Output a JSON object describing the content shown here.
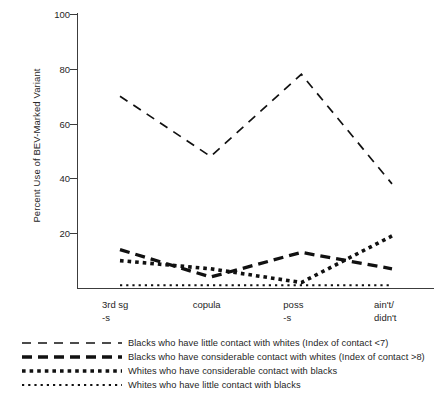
{
  "chart_data": {
    "type": "line",
    "title": "",
    "xlabel": "",
    "ylabel": "Percent Use of BEV-Marked Variant",
    "ylim": [
      0,
      100
    ],
    "yticks": [
      100,
      80,
      60,
      40,
      20
    ],
    "ytick_labels": [
      "100",
      "80",
      "60",
      "40",
      "20"
    ],
    "grid": false,
    "legend_position": "below",
    "categories": [
      "3rd sg -s",
      "copula",
      "poss -s",
      "ain't/didn't"
    ],
    "category_lines": [
      {
        "line1": "3rd sg",
        "line2": "-s"
      },
      {
        "line1": "copula",
        "line2": ""
      },
      {
        "line1": "poss",
        "line2": "-s"
      },
      {
        "line1": "ain't/",
        "line2": "didn't"
      }
    ],
    "series": [
      {
        "name": "Blacks who have little contact with whites (Index of contact <7)",
        "style": "thin-dash",
        "values": [
          70,
          48,
          78,
          38
        ]
      },
      {
        "name": "Blacks who have considerable contact with whites (Index of contact >8)",
        "style": "thick-dash",
        "values": [
          14,
          4,
          13,
          7
        ]
      },
      {
        "name": "Whites who have considerable contact with blacks",
        "style": "square-dot",
        "values": [
          10,
          7,
          2,
          19
        ]
      },
      {
        "name": "Whites who have little contact with blacks",
        "style": "small-dot",
        "values": [
          1,
          1,
          1,
          1
        ]
      }
    ]
  },
  "legend": {
    "items": [
      {
        "label": "Blacks who have little contact with whites (Index of contact <7)",
        "style": "thin-dash"
      },
      {
        "label": "Blacks who have considerable contact with whites (Index of contact >8)",
        "style": "thick-dash"
      },
      {
        "label": "Whites who have considerable contact with blacks",
        "style": "square-dot"
      },
      {
        "label": "Whites who have little contact with blacks",
        "style": "small-dot"
      }
    ]
  },
  "colors": {
    "line": "#111111",
    "axis": "#3c3c3c",
    "text": "#262626",
    "background": "#ffffff"
  }
}
